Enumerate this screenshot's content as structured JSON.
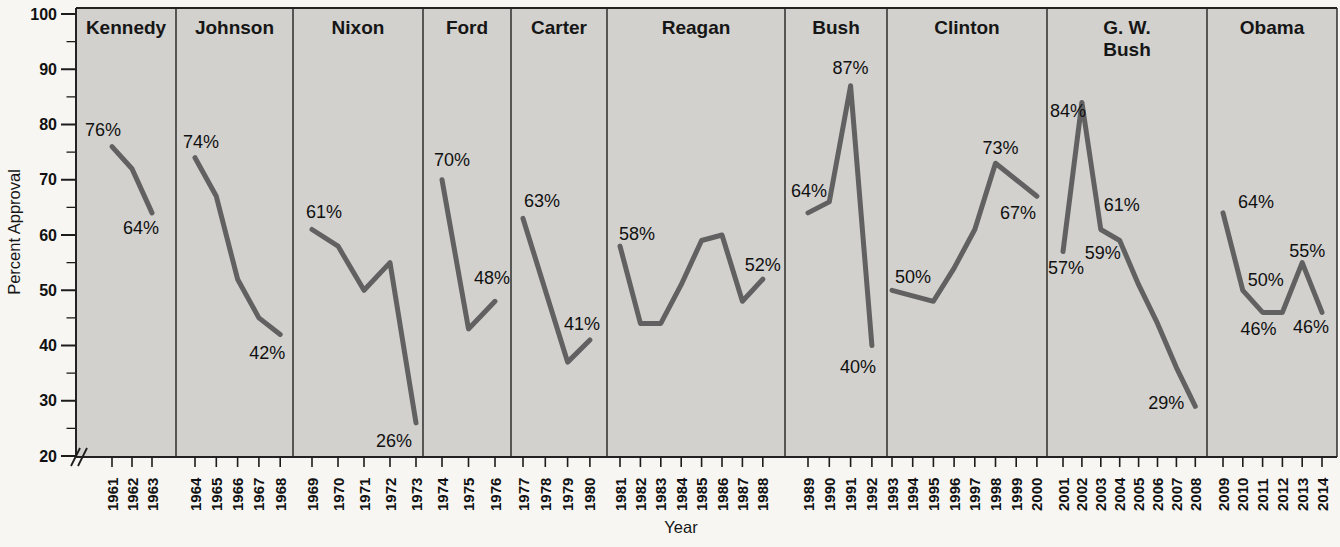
{
  "figure": {
    "colors": {
      "page_bg": "#f7f6f3",
      "panel_bg": "#d2d1ce",
      "line": "#616161",
      "axis": "#1c1c1c",
      "separator": "#222222",
      "text": "#111111"
    }
  },
  "chart_data": {
    "type": "line",
    "title": "",
    "ylabel": "Percent Approval",
    "xlabel": "Year",
    "ylim": [
      20,
      100
    ],
    "yticks": [
      20,
      30,
      40,
      50,
      60,
      70,
      80,
      90,
      100
    ],
    "y_minor_ticks": [
      25,
      35,
      45,
      55,
      65,
      75,
      85,
      95
    ],
    "y_axis_break": true,
    "grid": false,
    "legend": false,
    "panels": [
      {
        "president": "Kennedy",
        "name_lines": [
          "Kennedy"
        ],
        "years": [
          1961,
          1962,
          1963
        ],
        "values": [
          76,
          72,
          64
        ],
        "labels": [
          {
            "year": 1961,
            "text": "76%",
            "dx": -9,
            "dy": -17
          },
          {
            "year": 1963,
            "text": "64%",
            "dx": -11,
            "dy": 15
          }
        ],
        "x0": 112,
        "xstep": 20
      },
      {
        "president": "Johnson",
        "name_lines": [
          "Johnson"
        ],
        "years": [
          1964,
          1965,
          1966,
          1967,
          1968
        ],
        "values": [
          74,
          67,
          52,
          45,
          42
        ],
        "labels": [
          {
            "year": 1964,
            "text": "74%",
            "dx": 6,
            "dy": -16
          },
          {
            "year": 1968,
            "text": "42%",
            "dx": -13,
            "dy": 19
          }
        ],
        "x0": 195,
        "xstep": 21.3
      },
      {
        "president": "Nixon",
        "name_lines": [
          "Nixon"
        ],
        "years": [
          1969,
          1970,
          1971,
          1972,
          1973
        ],
        "values": [
          61,
          58,
          50,
          55,
          26
        ],
        "labels": [
          {
            "year": 1969,
            "text": "61%",
            "dx": 12,
            "dy": -17
          },
          {
            "year": 1973,
            "text": "26%",
            "dx": -22,
            "dy": 18
          }
        ],
        "x0": 312,
        "xstep": 26
      },
      {
        "president": "Ford",
        "name_lines": [
          "Ford"
        ],
        "years": [
          1974,
          1975,
          1976
        ],
        "values": [
          70,
          43,
          48
        ],
        "labels": [
          {
            "year": 1974,
            "text": "70%",
            "dx": 10,
            "dy": -20
          },
          {
            "year": 1976,
            "text": "48%",
            "dx": -3,
            "dy": -23
          }
        ],
        "x0": 442,
        "xstep": 26.5
      },
      {
        "president": "Carter",
        "name_lines": [
          "Carter"
        ],
        "years": [
          1977,
          1978,
          1979,
          1980
        ],
        "values": [
          63,
          50,
          37,
          41
        ],
        "labels": [
          {
            "year": 1977,
            "text": "63%",
            "dx": 19,
            "dy": -17
          },
          {
            "year": 1980,
            "text": "41%",
            "dx": -8,
            "dy": -16
          }
        ],
        "x0": 523,
        "xstep": 22.3
      },
      {
        "president": "Reagan",
        "name_lines": [
          "Reagan"
        ],
        "years": [
          1981,
          1982,
          1983,
          1984,
          1985,
          1986,
          1987,
          1988
        ],
        "values": [
          58,
          44,
          44,
          51,
          59,
          60,
          48,
          52
        ],
        "labels": [
          {
            "year": 1981,
            "text": "58%",
            "dx": 17,
            "dy": -12
          },
          {
            "year": 1988,
            "text": "52%",
            "dx": 0,
            "dy": -14
          }
        ],
        "x0": 620,
        "xstep": 20.4
      },
      {
        "president": "Bush",
        "name_lines": [
          "Bush"
        ],
        "years": [
          1989,
          1990,
          1991,
          1992
        ],
        "values": [
          64,
          66,
          87,
          40
        ],
        "labels": [
          {
            "year": 1989,
            "text": "64%",
            "dx": 1,
            "dy": -22
          },
          {
            "year": 1991,
            "text": "87%",
            "dx": 0,
            "dy": -18
          },
          {
            "year": 1992,
            "text": "40%",
            "dx": -14,
            "dy": 21
          }
        ],
        "x0": 808,
        "xstep": 21.3
      },
      {
        "president": "Clinton",
        "name_lines": [
          "Clinton"
        ],
        "years": [
          1993,
          1994,
          1995,
          1996,
          1997,
          1998,
          1999,
          2000
        ],
        "values": [
          50,
          49,
          48,
          54,
          61,
          73,
          70,
          67
        ],
        "labels": [
          {
            "year": 1993,
            "text": "50%",
            "dx": 21,
            "dy": -13
          },
          {
            "year": 1998,
            "text": "73%",
            "dx": 5,
            "dy": -15
          },
          {
            "year": 2000,
            "text": "67%",
            "dx": -19,
            "dy": 17
          }
        ],
        "x0": 892,
        "xstep": 20.7
      },
      {
        "president": "G. W. Bush",
        "name_lines": [
          "G. W.",
          "Bush"
        ],
        "years": [
          2001,
          2002,
          2003,
          2004,
          2005,
          2006,
          2007,
          2008
        ],
        "values": [
          57,
          84,
          61,
          59,
          51,
          44,
          36,
          29
        ],
        "labels": [
          {
            "year": 2001,
            "text": "57%",
            "dx": 3,
            "dy": 16
          },
          {
            "year": 2002,
            "text": "84%",
            "dx": -14,
            "dy": 9
          },
          {
            "year": 2003,
            "text": "61%",
            "dx": 21,
            "dy": -24
          },
          {
            "year": 2004,
            "text": "59%",
            "dx": -17,
            "dy": 12
          },
          {
            "year": 2008,
            "text": "29%",
            "dx": -29,
            "dy": -3
          }
        ],
        "x0": 1063,
        "xstep": 18.9
      },
      {
        "president": "Obama",
        "name_lines": [
          "Obama"
        ],
        "years": [
          2009,
          2010,
          2011,
          2012,
          2013,
          2014
        ],
        "values": [
          64,
          50,
          46,
          46,
          55,
          46
        ],
        "labels": [
          {
            "year": 2009,
            "text": "64%",
            "dx": 33,
            "dy": -11
          },
          {
            "year": 2010,
            "text": "50%",
            "dx": 23,
            "dy": -10
          },
          {
            "year": 2011,
            "text": "46%",
            "dx": -4,
            "dy": 17
          },
          {
            "year": 2013,
            "text": "55%",
            "dx": 5,
            "dy": -12
          },
          {
            "year": 2014,
            "text": "46%",
            "dx": -11,
            "dy": 15
          }
        ],
        "x0": 1223,
        "xstep": 19.8
      }
    ],
    "layout": {
      "width": 1340,
      "height": 547,
      "plot_top": 8,
      "plot_bottom": 457,
      "value_y_origin": 14,
      "px_per_value": 5.525,
      "panel_bounds_x": [
        76,
        176,
        293,
        423,
        511,
        607,
        785,
        887,
        1047,
        1207,
        1337
      ],
      "axis_x": 76,
      "ylabel_pos": [
        20,
        232
      ],
      "xlabel_pos": [
        681,
        533
      ]
    }
  }
}
